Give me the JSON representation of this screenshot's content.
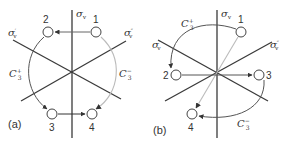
{
  "colors": {
    "axis": "#3a3a3a",
    "dark_arrow": "#555555",
    "light_arrow": "#b8b8b8",
    "circle_stroke": "#444444",
    "text": "#333333"
  },
  "panel_a": {
    "label": "(a)",
    "planes": {
      "sv": "σ",
      "sv_sub": "v",
      "svp": "σ",
      "svp_sub": "v",
      "svp_mark": "′",
      "svpp": "σ",
      "svpp_sub": "v",
      "svpp_mark": "″"
    },
    "points": [
      "1",
      "2",
      "3",
      "4"
    ],
    "rotations": {
      "plus": "C",
      "plus_sub": "3",
      "plus_sup": "+",
      "minus": "C",
      "minus_sub": "3",
      "minus_sup": "−"
    }
  },
  "panel_b": {
    "label": "(b)",
    "planes": {
      "sv": "σ",
      "sv_sub": "v",
      "svp": "σ",
      "svp_sub": "v",
      "svp_mark": "′",
      "svpp": "σ",
      "svpp_sub": "v",
      "svpp_mark": "″"
    },
    "points": [
      "1",
      "2",
      "3",
      "4"
    ],
    "rotations": {
      "plus": "C",
      "plus_sub": "3",
      "plus_sup": "+",
      "minus": "C",
      "minus_sub": "3",
      "minus_sup": "−"
    }
  }
}
